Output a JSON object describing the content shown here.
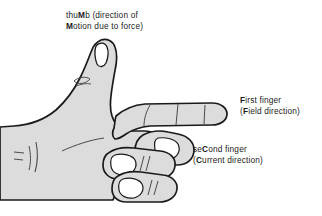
{
  "diagram": {
    "colors": {
      "background": "#ffffff",
      "hand_fill": "#dcdcdc",
      "hand_outline": "#1a1a1a",
      "nail_fill": "#ffffff",
      "text": "#1a1a1a"
    }
  },
  "labels": {
    "thumb": {
      "name": "thumb-label",
      "line1_prefix": "thu",
      "line1_bold": "M",
      "line1_suffix": "b (direction of",
      "line2_bold": "M",
      "line2_suffix": "otion due to force)",
      "full_text": "thuMb (direction of Motion due to force)"
    },
    "first_finger": {
      "name": "first-finger-label",
      "line1_bold": "F",
      "line1_suffix": "irst finger",
      "line2_prefix": "(",
      "line2_bold": "F",
      "line2_suffix": "ield direction)",
      "full_text": "First finger (Field direction)"
    },
    "second_finger": {
      "name": "second-finger-label",
      "line1_prefix": "se",
      "line1_bold": "C",
      "line1_suffix": "ond finger",
      "line2_prefix": "(",
      "line2_bold": "C",
      "line2_suffix": "urrent direction)",
      "full_text": "seCond finger (Current direction)"
    }
  }
}
